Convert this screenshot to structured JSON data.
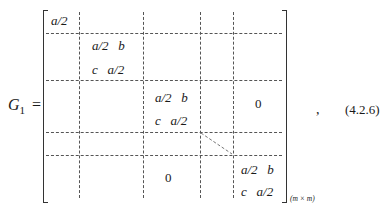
{
  "equation": {
    "lhs": {
      "symbol": "G",
      "subscript": "1",
      "equals": "="
    },
    "matrix": {
      "blocks": [
        {
          "row1": "a/2",
          "row2": ""
        },
        {
          "row1": "a/2   b",
          "row2": "c   a/2"
        },
        {
          "row1": "a/2   b",
          "row2": "c   a/2"
        },
        {
          "row1": "a/2   b",
          "row2": "c   a/2"
        }
      ],
      "zero_upper": "0",
      "zero_lower": "0",
      "dimension_subscript": "(m × m)"
    },
    "punctuation": ",",
    "number": "(4.2.6)"
  }
}
